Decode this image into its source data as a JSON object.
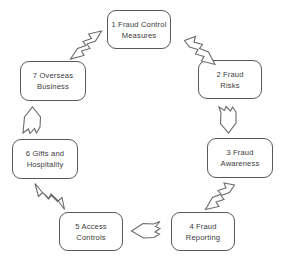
{
  "diagram": {
    "stroke_color": "#58585a",
    "arrow_stroke_color": "#6a6a6c",
    "background_color": "#ffffff",
    "text_color": "#3b3b3d",
    "nodes": [
      {
        "number": "1",
        "label": "1   Fraud Control\nMeasures"
      },
      {
        "number": "2",
        "label": "2   Fraud\nRisks"
      },
      {
        "number": "3",
        "label": "3   Fraud\nAwareness"
      },
      {
        "number": "4",
        "label": "4   Fraud\nReporting"
      },
      {
        "number": "5",
        "label": "5   Access\nControls"
      },
      {
        "number": "6",
        "label": "6   Gifts and\nHospitality"
      },
      {
        "number": "7",
        "label": "7   Overseas\nBusiness"
      }
    ],
    "arrows": [
      {
        "from": "1",
        "to": "2",
        "direction": "down-right"
      },
      {
        "from": "2",
        "to": "3",
        "direction": "down"
      },
      {
        "from": "3",
        "to": "4",
        "direction": "down-left"
      },
      {
        "from": "4",
        "to": "5",
        "direction": "left"
      },
      {
        "from": "5",
        "to": "6",
        "direction": "up-left"
      },
      {
        "from": "6",
        "to": "7",
        "direction": "up"
      },
      {
        "from": "7",
        "to": "1",
        "direction": "up-right"
      }
    ]
  }
}
